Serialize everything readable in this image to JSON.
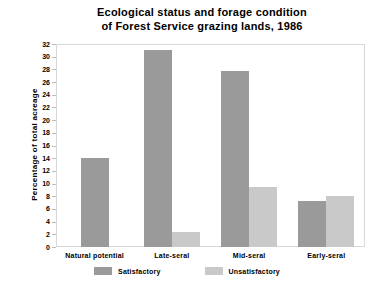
{
  "chart_data": {
    "type": "bar",
    "title": "Ecological status and forage condition\nof Forest Service grazing lands, 1986",
    "xlabel": "",
    "ylabel": "Percentage of total acreage",
    "ylim": [
      0,
      32
    ],
    "ytick_step": 2,
    "yticks": [
      0,
      2,
      4,
      6,
      8,
      10,
      12,
      14,
      16,
      18,
      20,
      22,
      24,
      26,
      28,
      30,
      32
    ],
    "grid": false,
    "legend_position": "bottom",
    "categories": [
      "Natural potential",
      "Late-seral",
      "Mid-seral",
      "Early-seral"
    ],
    "series": [
      {
        "name": "Satisfactory",
        "color": "#9a9a9a",
        "values": [
          14.0,
          31.0,
          27.7,
          7.3
        ]
      },
      {
        "name": "Unsatisfactory",
        "color": "#c9c9c9",
        "values": [
          null,
          2.3,
          9.5,
          8.1
        ]
      }
    ]
  },
  "colors": {
    "satisfactory": "#9a9a9a",
    "unsatisfactory": "#c9c9c9",
    "frame": "#d8d8d8",
    "text": "#000000",
    "background": "#ffffff"
  }
}
